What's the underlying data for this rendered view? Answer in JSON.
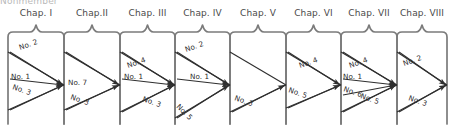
{
  "figure": {
    "type": "flow-diagram",
    "cut_header_text": "Nonmember",
    "chapter_count": 8,
    "box_top_shape": "brace-with-center-peak",
    "box_bottom_shape": "rounded-corners",
    "line_color": "#7b7b7b",
    "flow_color": "#2f2f2f",
    "background": "#ffffff"
  },
  "chapters": [
    {
      "id": "chap-1",
      "label": "Chap. I",
      "x": 8,
      "width": 56,
      "flows": [
        {
          "label": "No. 2",
          "from_y": 52,
          "label_x": 20,
          "label_y": 50,
          "rot": 19
        },
        {
          "label": "No. 1",
          "from_y": 79,
          "label_x": 11,
          "label_y": 79,
          "rot": 0
        },
        {
          "label": "No. 3",
          "from_y": 110,
          "label_x": 12,
          "label_y": 89,
          "rot": -19
        }
      ],
      "converge_y": 85
    },
    {
      "id": "chap-2",
      "label": "Chap.II",
      "x": 64,
      "width": 56,
      "flows": [
        {
          "label": "No. 7",
          "from_y": 52,
          "label_x": 68,
          "label_y": 85,
          "rot": 0
        },
        {
          "label": "No. 3",
          "from_y": 110,
          "label_x": 70,
          "label_y": 99,
          "rot": -19
        }
      ],
      "converge_y": 85
    },
    {
      "id": "chap-3",
      "label": "Chap. III",
      "x": 120,
      "width": 55,
      "flows": [
        {
          "label": "No. 4",
          "from_y": 52,
          "label_x": 128,
          "label_y": 68,
          "rot": 19
        },
        {
          "label": "No. 1",
          "from_y": 79,
          "label_x": 124,
          "label_y": 79,
          "rot": 0
        },
        {
          "label": "No. 3",
          "from_y": 112,
          "label_x": 142,
          "label_y": 101,
          "rot": -19
        }
      ],
      "converge_y": 85
    },
    {
      "id": "chap-4",
      "label": "Chap. IV",
      "x": 175,
      "width": 55,
      "flows": [
        {
          "label": "No. 2",
          "from_y": 52,
          "label_x": 186,
          "label_y": 52,
          "rot": 19
        },
        {
          "label": "No. 1",
          "from_y": 79,
          "label_x": 190,
          "label_y": 79,
          "rot": 0
        },
        {
          "label": "No. 5",
          "from_y": 118,
          "label_x": 176,
          "label_y": 107,
          "rot": -45
        }
      ],
      "converge_y": 85
    },
    {
      "id": "chap-5",
      "label": "Chap. V",
      "x": 230,
      "width": 56,
      "flows": [
        {
          "label": "No. 3",
          "from_y": 112,
          "label_x": 234,
          "label_y": 100,
          "rot": -19
        }
      ],
      "converge_y": 85
    },
    {
      "id": "chap-6",
      "label": "Chap. VI",
      "x": 286,
      "width": 55,
      "flows": [
        {
          "label": "No. 4",
          "from_y": 52,
          "label_x": 300,
          "label_y": 68,
          "rot": 19
        },
        {
          "label": "No. 5",
          "from_y": 108,
          "label_x": 288,
          "label_y": 92,
          "rot": -19
        }
      ],
      "converge_y": 85
    },
    {
      "id": "chap-7",
      "label": "Chap. VII",
      "x": 341,
      "width": 56,
      "flows": [
        {
          "label": "No. 4",
          "from_y": 52,
          "label_x": 350,
          "label_y": 68,
          "rot": 19
        },
        {
          "label": "No. 1",
          "from_y": 79,
          "label_x": 343,
          "label_y": 79,
          "rot": 0
        },
        {
          "label": "No. 6",
          "from_y": 95,
          "label_x": 343,
          "label_y": 91,
          "rot": -19
        },
        {
          "label": "No. 5",
          "from_y": 112,
          "label_x": 360,
          "label_y": 98,
          "rot": -19
        }
      ],
      "converge_y": 85
    },
    {
      "id": "chap-8",
      "label": "Chap. VIII",
      "x": 397,
      "width": 50,
      "flows": [
        {
          "label": "No. 2",
          "from_y": 52,
          "label_x": 404,
          "label_y": 66,
          "rot": 19
        },
        {
          "label": "No. 3",
          "from_y": 112,
          "label_x": 408,
          "label_y": 100,
          "rot": -19
        }
      ],
      "converge_y": 85
    }
  ]
}
